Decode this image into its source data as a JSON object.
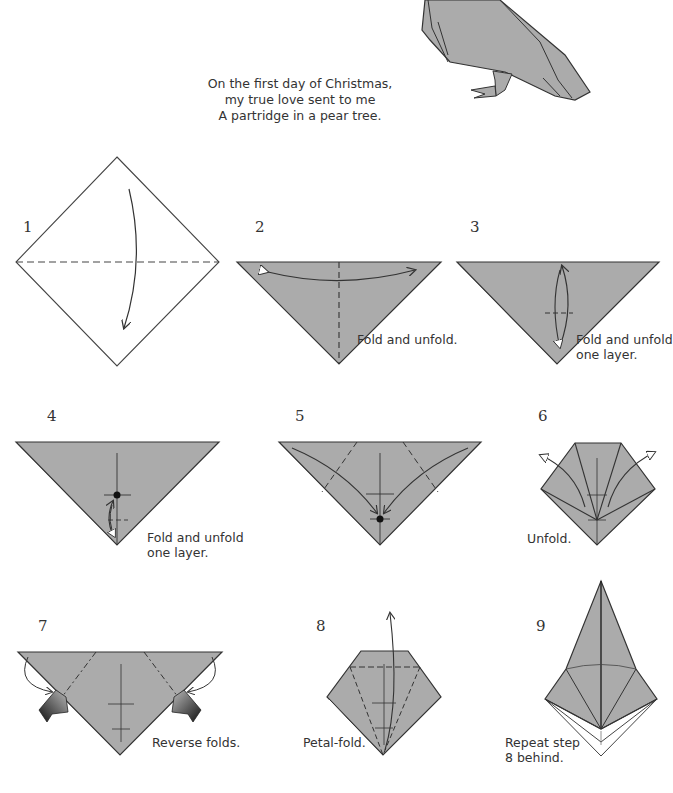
{
  "poem": {
    "lines": [
      "On the first day of Christmas,",
      "my true love sent to me",
      "A partridge in a pear tree."
    ]
  },
  "colors": {
    "paper": "#ababab",
    "line": "#3a3a3a",
    "background": "#ffffff"
  },
  "steps": [
    {
      "number": "1",
      "caption": ""
    },
    {
      "number": "2",
      "caption": "Fold and unfold."
    },
    {
      "number": "3",
      "caption_line1": "Fold and unfold",
      "caption_line2": "one layer."
    },
    {
      "number": "4",
      "caption_line1": "Fold and unfold",
      "caption_line2": "one layer."
    },
    {
      "number": "5",
      "caption": ""
    },
    {
      "number": "6",
      "caption": "Unfold."
    },
    {
      "number": "7",
      "caption": "Reverse folds."
    },
    {
      "number": "8",
      "caption": "Petal-fold."
    },
    {
      "number": "9",
      "caption_line1": "Repeat step",
      "caption_line2": "8 behind."
    }
  ]
}
